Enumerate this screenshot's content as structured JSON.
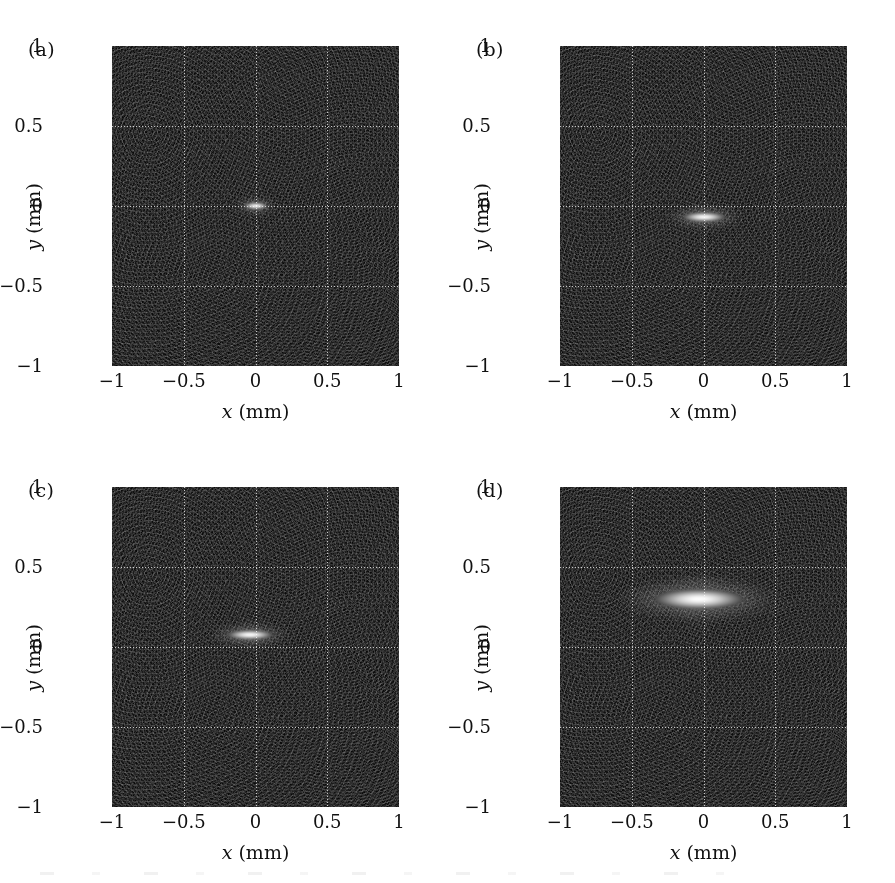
{
  "figure": {
    "panel_count": 4,
    "layout": "2x2",
    "background_color": "#ffffff",
    "image_background_color": "#111111",
    "grid_color": "#ffffff",
    "grid_style": "dotted"
  },
  "axes": {
    "x_title_var": "x",
    "x_title_unit": " (mm)",
    "y_title_var": "y",
    "y_title_unit": " (mm)",
    "x_ticks": [
      "−1",
      "−0.5",
      "0",
      "0.5",
      "1"
    ],
    "y_ticks": [
      "1",
      "0.5",
      "0",
      "−0.5",
      "−1"
    ],
    "x_tick_values": [
      -1,
      -0.5,
      0,
      0.5,
      1
    ],
    "y_tick_values": [
      1,
      0.5,
      0,
      -0.5,
      -1
    ],
    "xlim": [
      -1,
      1
    ],
    "ylim": [
      -1,
      1
    ],
    "grid_x": [
      -0.5,
      0,
      0.5
    ],
    "grid_y": [
      -0.5,
      0,
      0.5
    ]
  },
  "panels": [
    {
      "label": "(a)"
    },
    {
      "label": "(b)"
    },
    {
      "label": "(c)"
    },
    {
      "label": "(d)"
    }
  ],
  "chart_data": {
    "type": "heatmap",
    "title": "",
    "subtitle": "",
    "xlabel": "x (mm)",
    "ylabel": "y (mm)",
    "xlim": [
      -1,
      1
    ],
    "ylim": [
      -1,
      1
    ],
    "grid": true,
    "grid_x": [
      -0.5,
      0,
      0.5
    ],
    "grid_y": [
      -0.5,
      0,
      0.5
    ],
    "legend": "none",
    "colormap": "grayscale",
    "panels": [
      {
        "label": "(a)",
        "center_x": 0.0,
        "center_y": 0.0,
        "width_mm": 0.17,
        "height_mm": 0.045,
        "peak_brightness": 1.0,
        "lobes": [
          {
            "offset_y": 0.055,
            "width_mm": 0.1,
            "height_mm": 0.018,
            "brightness": 0.3
          },
          {
            "offset_y": -0.055,
            "width_mm": 0.1,
            "height_mm": 0.018,
            "brightness": 0.26
          }
        ]
      },
      {
        "label": "(b)",
        "center_x": 0.0,
        "center_y": -0.07,
        "width_mm": 0.3,
        "height_mm": 0.062,
        "peak_brightness": 1.0,
        "lobes": [
          {
            "offset_y": 0.075,
            "width_mm": 0.2,
            "height_mm": 0.028,
            "brightness": 0.34
          },
          {
            "offset_y": -0.075,
            "width_mm": 0.18,
            "height_mm": 0.024,
            "brightness": 0.24
          }
        ]
      },
      {
        "label": "(c)",
        "center_x": -0.04,
        "center_y": 0.075,
        "width_mm": 0.32,
        "height_mm": 0.065,
        "peak_brightness": 1.0,
        "lobes": [
          {
            "offset_y": 0.08,
            "width_mm": 0.22,
            "height_mm": 0.03,
            "brightness": 0.32
          },
          {
            "offset_y": -0.08,
            "width_mm": 0.17,
            "height_mm": 0.026,
            "brightness": 0.26
          }
        ]
      },
      {
        "label": "(d)",
        "center_x": -0.03,
        "center_y": 0.3,
        "width_mm": 0.62,
        "height_mm": 0.13,
        "peak_brightness": 1.0,
        "lobes": [
          {
            "offset_y": 0.115,
            "width_mm": 0.46,
            "height_mm": 0.055,
            "brightness": 0.42
          },
          {
            "offset_y": -0.105,
            "width_mm": 0.44,
            "height_mm": 0.05,
            "brightness": 0.38
          },
          {
            "offset_y": -0.175,
            "width_mm": 0.3,
            "height_mm": 0.04,
            "brightness": 0.22
          }
        ]
      }
    ],
    "noise": {
      "type": "speckle",
      "mean_level": 0.07,
      "std": 0.04
    }
  }
}
